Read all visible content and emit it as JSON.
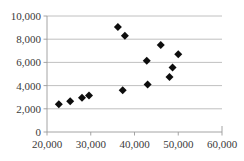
{
  "chart_data": {
    "type": "scatter",
    "title": "",
    "subtitle": "",
    "xlabel": "",
    "ylabel": "",
    "xlim": [
      20000,
      60000
    ],
    "ylim": [
      0,
      10000
    ],
    "xticks": [
      20000,
      30000,
      40000,
      50000,
      60000
    ],
    "yticks": [
      0,
      2000,
      4000,
      6000,
      8000,
      10000
    ],
    "xtick_labels": [
      "20,000",
      "30,000",
      "40,000",
      "50,000",
      "60,000"
    ],
    "ytick_labels": [
      "0",
      "2,000",
      "4,000",
      "6,000",
      "8,000",
      "10,000"
    ],
    "grid": "horizontal",
    "legend": "none",
    "marker": "diamond",
    "marker_color": "#0d0d0d",
    "series": [
      {
        "name": "Series 1",
        "points": [
          [
            22700,
            2400
          ],
          [
            25300,
            2650
          ],
          [
            28000,
            2950
          ],
          [
            29600,
            3150
          ],
          [
            36200,
            9050
          ],
          [
            37300,
            3600
          ],
          [
            37800,
            8300
          ],
          [
            42800,
            6150
          ],
          [
            43000,
            4100
          ],
          [
            46000,
            7500
          ],
          [
            48000,
            4750
          ],
          [
            48700,
            5550
          ],
          [
            50000,
            6700
          ]
        ]
      }
    ]
  }
}
